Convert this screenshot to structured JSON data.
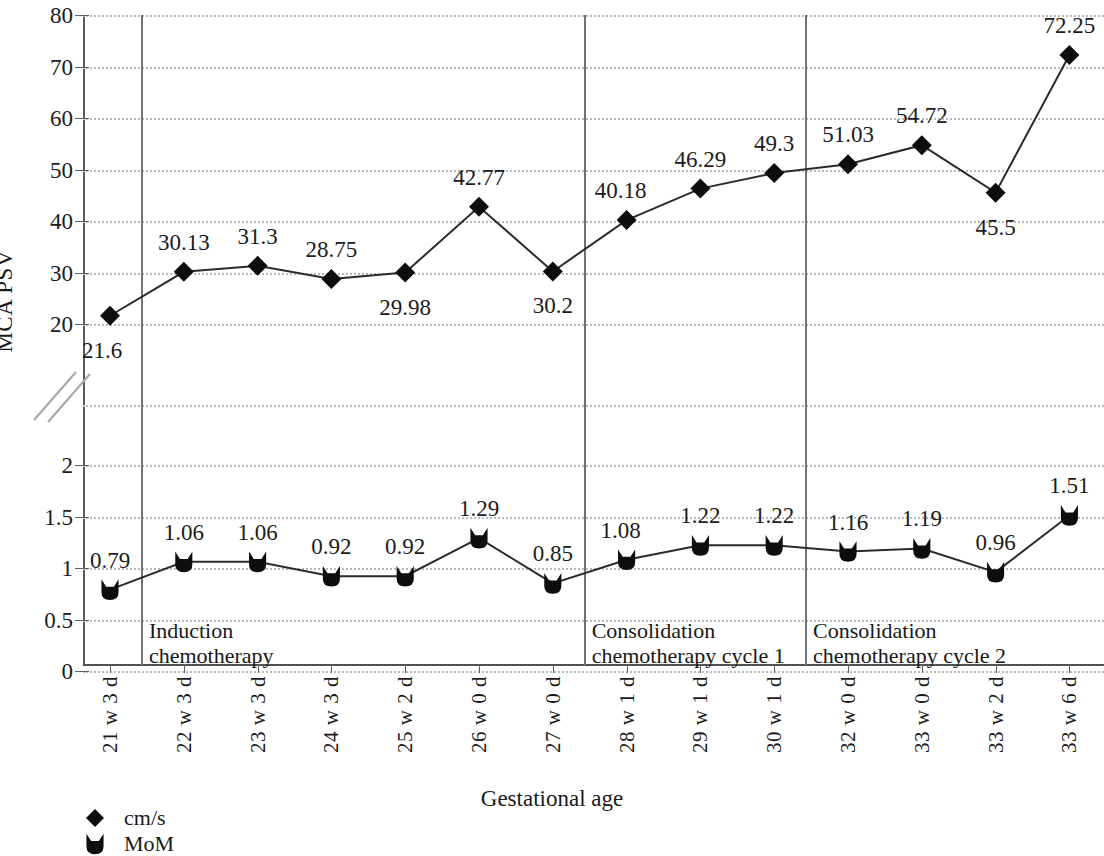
{
  "chart_data": {
    "type": "line",
    "title": "",
    "xlabel": "Gestational age",
    "ylabel": "MCA PSV",
    "grid": true,
    "legend_position": "bottom-left",
    "broken_axis": true,
    "y_axis": {
      "lower_segment": {
        "ticks": [
          0,
          0.5,
          1,
          1.5,
          2
        ],
        "range": [
          0,
          2
        ]
      },
      "upper_segment": {
        "ticks": [
          20,
          30,
          40,
          50,
          60,
          70,
          80
        ],
        "range": [
          20,
          80
        ]
      },
      "tick_labels": [
        "0",
        "0.5",
        "1",
        "1.5",
        "2",
        "20",
        "30",
        "40",
        "50",
        "60",
        "70",
        "80"
      ]
    },
    "categories": [
      "21 w 3 d",
      "22 w 3 d",
      "23 w 3 d",
      "24 w 3 d",
      "25 w 2 d",
      "26 w 0 d",
      "27 w 0 d",
      "28 w 1 d",
      "29 w 1 d",
      "30 w 1 d",
      "32 w 0 d",
      "33 w 0 d",
      "33 w 2 d",
      "33 w 6 d"
    ],
    "series": [
      {
        "name": "cm/s",
        "marker": "diamond",
        "axis_segment": "upper",
        "values": [
          21.6,
          30.13,
          31.3,
          28.75,
          29.98,
          42.77,
          30.2,
          40.18,
          46.29,
          49.3,
          51.03,
          54.72,
          45.5,
          72.25
        ],
        "labels": [
          "21.6",
          "30.13",
          "31.3",
          "28.75",
          "29.98",
          "42.77",
          "30.2",
          "40.18",
          "46.29",
          "49.3",
          "51.03",
          "54.72",
          "45.5",
          "72.25"
        ],
        "label_positions": [
          "below-left",
          "above",
          "above",
          "above",
          "below",
          "above",
          "below",
          "left",
          "above",
          "above",
          "above",
          "above",
          "below",
          "above"
        ]
      },
      {
        "name": "MoM",
        "marker": "shield",
        "axis_segment": "lower",
        "values": [
          0.79,
          1.06,
          1.06,
          0.92,
          0.92,
          1.29,
          0.85,
          1.08,
          1.22,
          1.22,
          1.16,
          1.19,
          0.96,
          1.51
        ],
        "labels": [
          "0.79",
          "1.06",
          "1.06",
          "0.92",
          "0.92",
          "1.29",
          "0.85",
          "1.08",
          "1.22",
          "1.22",
          "1.16",
          "1.19",
          "0.96",
          "1.51"
        ],
        "label_positions": [
          "above",
          "above",
          "above",
          "above",
          "above",
          "above",
          "above",
          "left",
          "above",
          "above",
          "above",
          "above",
          "above",
          "above"
        ]
      }
    ],
    "annotations": [
      {
        "text": "Induction\nchemotherapy",
        "after_category_index": 0
      },
      {
        "text": "Consolidation\nchemotherapy cycle 1",
        "after_category_index": 6
      },
      {
        "text": "Consolidation\nchemotherapy cycle 2",
        "after_category_index": 9
      }
    ],
    "dividers_after_index": [
      0,
      6,
      9
    ],
    "colors": {
      "marker": "#0d0d0d",
      "line": "#2b2b2b",
      "grid": "#b9b9b9",
      "axis": "#555b5e",
      "text": "#1b1b1b"
    }
  },
  "legend": {
    "items": [
      {
        "label": "cm/s",
        "marker": "diamond"
      },
      {
        "label": "MoM",
        "marker": "shield"
      }
    ]
  }
}
